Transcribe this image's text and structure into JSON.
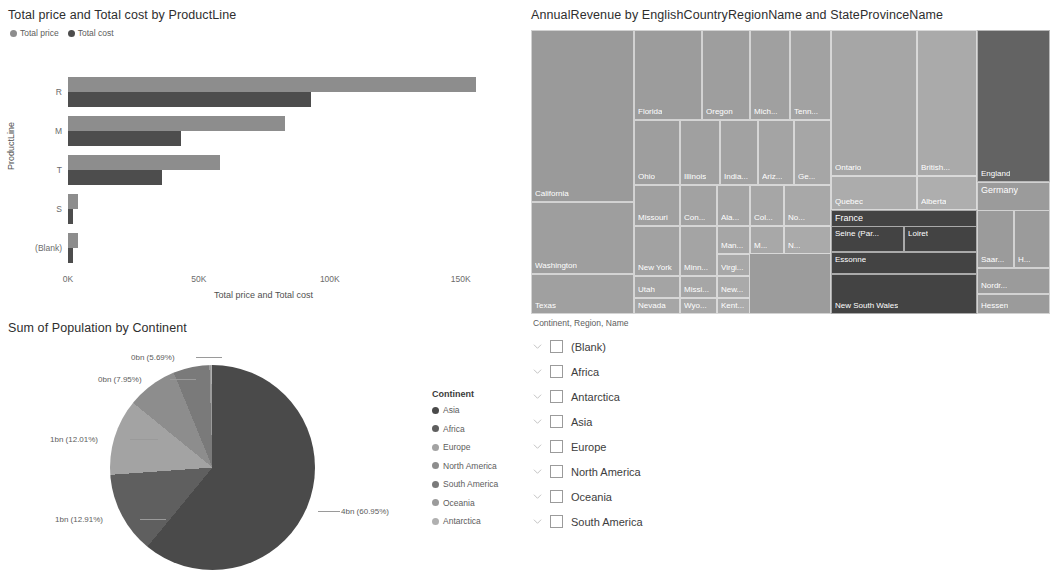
{
  "bar_chart": {
    "title": "Total price and Total cost by ProductLine",
    "legend": [
      {
        "label": "Total price",
        "color": "#8d8d8d"
      },
      {
        "label": "Total cost",
        "color": "#4d4d4d"
      }
    ],
    "x_axis_title": "Total price and Total cost",
    "y_axis_title": "ProductLine",
    "x_ticks": [
      "0K",
      "50K",
      "100K",
      "150K"
    ]
  },
  "chart_data": [
    {
      "type": "bar",
      "title": "Total price and Total cost by ProductLine",
      "xlabel": "Total price and Total cost",
      "ylabel": "ProductLine",
      "orientation": "horizontal",
      "categories": [
        "R",
        "M",
        "T",
        "S",
        "(Blank)"
      ],
      "series": [
        {
          "name": "Total price",
          "color": "#8d8d8d",
          "values": [
            156000,
            83000,
            58000,
            4000,
            4000
          ]
        },
        {
          "name": "Total cost",
          "color": "#4d4d4d",
          "values": [
            93000,
            43000,
            36000,
            2000,
            2000
          ]
        }
      ],
      "xlim": [
        0,
        165000
      ],
      "xticks": [
        0,
        50000,
        100000,
        150000
      ],
      "xticklabels": [
        "0K",
        "50K",
        "100K",
        "150K"
      ],
      "grid": false,
      "legend_position": "top-left"
    },
    {
      "type": "treemap",
      "title": "AnnualRevenue by EnglishCountryRegionName and StateProvinceName",
      "groups": [
        {
          "name": "United States",
          "color": "#9b9b9b",
          "children": [
            "California",
            "Washington",
            "Texas",
            "Florida",
            "Oregon",
            "Mich...",
            "Tenn...",
            "Ohio",
            "Illinois",
            "India...",
            "Ariz...",
            "Ge...",
            "Missouri",
            "New York",
            "Utah",
            "Nevada",
            "Con...",
            "Minn...",
            "Missi...",
            "Wyo...",
            "Ala...",
            "Man...",
            "Virgi...",
            "New...",
            "Kent...",
            "Col...",
            "M...",
            "No...",
            "N..."
          ]
        },
        {
          "name": "Canada",
          "color": "#a8a8a8",
          "children": [
            "Ontario",
            "British...",
            "Quebec",
            "Alberta"
          ]
        },
        {
          "name": "France",
          "color": "#4a4a4a",
          "children": [
            "Seine (Par...",
            "Loiret",
            "Essonne"
          ]
        },
        {
          "name": "Australia",
          "color": "#4a4a4a",
          "children": [
            "New South Wales"
          ]
        },
        {
          "name": "United ...",
          "color": "#636363",
          "children": [
            "England"
          ]
        },
        {
          "name": "Germany",
          "color": "#9b9b9b",
          "children": [
            "Saar...",
            "H...",
            "Nordr...",
            "Hessen"
          ]
        }
      ]
    },
    {
      "type": "pie",
      "title": "Sum of Population by Continent",
      "legend_title": "Continent",
      "labels": [
        "Asia",
        "Africa",
        "Europe",
        "North America",
        "South America",
        "Oceania",
        "Antarctica"
      ],
      "values": [
        60.95,
        12.91,
        12.01,
        7.95,
        5.69,
        0.3,
        0.19
      ],
      "value_labels": [
        "4bn (60.95%)",
        "1bn (12.91%)",
        "1bn (12.01%)",
        "0bn (7.95%)",
        "0bn (5.69%)"
      ],
      "colors": [
        "#4a4a4a",
        "#5f5f5f",
        "#a3a3a3",
        "#8d8d8d",
        "#7a7a7a",
        "#9b9b9b",
        "#b0b0b0"
      ],
      "legend_position": "right"
    }
  ],
  "treemap": {
    "title": "AnnualRevenue by EnglishCountryRegionName and StateProvinceName",
    "cells": [
      {
        "label": "United States",
        "x": 0,
        "y": 0,
        "w": 300,
        "h": 284,
        "color": "#9c9c9c",
        "pos": "tl",
        "size": 9
      },
      {
        "label": "California",
        "x": 0,
        "y": 0,
        "w": 103,
        "h": 172,
        "color": "#9a9a9a",
        "pos": "bl"
      },
      {
        "label": "Washington",
        "x": 0,
        "y": 172,
        "w": 103,
        "h": 72,
        "color": "#9e9e9e",
        "pos": "bl"
      },
      {
        "label": "Texas",
        "x": 0,
        "y": 244,
        "w": 103,
        "h": 40,
        "color": "#a0a0a0",
        "pos": "bl"
      },
      {
        "label": "Florida",
        "x": 103,
        "y": 0,
        "w": 68,
        "h": 90,
        "color": "#9c9c9c",
        "pos": "bl"
      },
      {
        "label": "Oregon",
        "x": 171,
        "y": 0,
        "w": 48,
        "h": 90,
        "color": "#9e9e9e",
        "pos": "bl"
      },
      {
        "label": "Mich...",
        "x": 219,
        "y": 0,
        "w": 40,
        "h": 90,
        "color": "#a0a0a0",
        "pos": "bl"
      },
      {
        "label": "Tenn...",
        "x": 259,
        "y": 0,
        "w": 41,
        "h": 90,
        "color": "#a2a2a2",
        "pos": "bl"
      },
      {
        "label": "Ohio",
        "x": 103,
        "y": 90,
        "w": 46,
        "h": 65,
        "color": "#9e9e9e",
        "pos": "bl"
      },
      {
        "label": "Illinois",
        "x": 149,
        "y": 90,
        "w": 40,
        "h": 65,
        "color": "#a0a0a0",
        "pos": "bl"
      },
      {
        "label": "India...",
        "x": 189,
        "y": 90,
        "w": 38,
        "h": 65,
        "color": "#a2a2a2",
        "pos": "bl"
      },
      {
        "label": "Ariz...",
        "x": 227,
        "y": 90,
        "w": 36,
        "h": 65,
        "color": "#a4a4a4",
        "pos": "bl"
      },
      {
        "label": "Ge...",
        "x": 263,
        "y": 90,
        "w": 37,
        "h": 65,
        "color": "#a6a6a6",
        "pos": "bl"
      },
      {
        "label": "Missouri",
        "x": 103,
        "y": 155,
        "w": 46,
        "h": 41,
        "color": "#a0a0a0",
        "pos": "bl"
      },
      {
        "label": "New York",
        "x": 103,
        "y": 196,
        "w": 46,
        "h": 50,
        "color": "#a2a2a2",
        "pos": "bl"
      },
      {
        "label": "Utah",
        "x": 103,
        "y": 246,
        "w": 46,
        "h": 22,
        "color": "#a4a4a4",
        "pos": "bl"
      },
      {
        "label": "Nevada",
        "x": 103,
        "y": 268,
        "w": 46,
        "h": 16,
        "color": "#a6a6a6",
        "pos": "bl"
      },
      {
        "label": "Con...",
        "x": 149,
        "y": 155,
        "w": 37,
        "h": 41,
        "color": "#a2a2a2",
        "pos": "bl"
      },
      {
        "label": "Minn...",
        "x": 149,
        "y": 196,
        "w": 37,
        "h": 50,
        "color": "#a4a4a4",
        "pos": "bl"
      },
      {
        "label": "Missi...",
        "x": 149,
        "y": 246,
        "w": 37,
        "h": 22,
        "color": "#a6a6a6",
        "pos": "bl"
      },
      {
        "label": "Wyo...",
        "x": 149,
        "y": 268,
        "w": 37,
        "h": 16,
        "color": "#a8a8a8",
        "pos": "bl"
      },
      {
        "label": "Ala...",
        "x": 186,
        "y": 155,
        "w": 33,
        "h": 41,
        "color": "#a4a4a4",
        "pos": "bl"
      },
      {
        "label": "Man...",
        "x": 186,
        "y": 196,
        "w": 33,
        "h": 28,
        "color": "#a6a6a6",
        "pos": "bl"
      },
      {
        "label": "Virgi...",
        "x": 186,
        "y": 224,
        "w": 33,
        "h": 22,
        "color": "#a8a8a8",
        "pos": "bl"
      },
      {
        "label": "New...",
        "x": 186,
        "y": 246,
        "w": 33,
        "h": 22,
        "color": "#aaaaaa",
        "pos": "bl"
      },
      {
        "label": "Kent...",
        "x": 186,
        "y": 268,
        "w": 33,
        "h": 16,
        "color": "#acacac",
        "pos": "bl"
      },
      {
        "label": "Col...",
        "x": 219,
        "y": 155,
        "w": 34,
        "h": 41,
        "color": "#a6a6a6",
        "pos": "bl"
      },
      {
        "label": "M...",
        "x": 219,
        "y": 196,
        "w": 34,
        "h": 28,
        "color": "#a8a8a8",
        "pos": "bl"
      },
      {
        "label": "No...",
        "x": 253,
        "y": 155,
        "w": 47,
        "h": 41,
        "color": "#a8a8a8",
        "pos": "bl"
      },
      {
        "label": "N...",
        "x": 253,
        "y": 196,
        "w": 47,
        "h": 28,
        "color": "#aaaaaa",
        "pos": "bl"
      },
      {
        "label": "Canada",
        "x": 300,
        "y": 0,
        "w": 146,
        "h": 180,
        "color": "#a8a8a8",
        "pos": "tl",
        "size": 9
      },
      {
        "label": "Ontario",
        "x": 300,
        "y": 0,
        "w": 86,
        "h": 146,
        "color": "#a6a6a6",
        "pos": "bl"
      },
      {
        "label": "British...",
        "x": 386,
        "y": 0,
        "w": 60,
        "h": 146,
        "color": "#aaaaaa",
        "pos": "bl"
      },
      {
        "label": "Quebec",
        "x": 300,
        "y": 146,
        "w": 86,
        "h": 34,
        "color": "#acacac",
        "pos": "bl"
      },
      {
        "label": "Alberta",
        "x": 386,
        "y": 146,
        "w": 60,
        "h": 34,
        "color": "#aeaeae",
        "pos": "bl"
      },
      {
        "label": "United ...",
        "x": 446,
        "y": 0,
        "w": 73,
        "h": 152,
        "color": "#636363",
        "pos": "tl",
        "size": 9
      },
      {
        "label": "England",
        "x": 446,
        "y": 0,
        "w": 73,
        "h": 152,
        "color": "#636363",
        "pos": "bl"
      },
      {
        "label": "France",
        "x": 300,
        "y": 180,
        "w": 146,
        "h": 64,
        "color": "#434343",
        "pos": "tl",
        "size": 9
      },
      {
        "label": "Seine (Par...",
        "x": 300,
        "y": 196,
        "w": 73,
        "h": 26,
        "color": "#434343",
        "pos": "tl"
      },
      {
        "label": "Loiret",
        "x": 373,
        "y": 196,
        "w": 73,
        "h": 26,
        "color": "#434343",
        "pos": "tl"
      },
      {
        "label": "Essonne",
        "x": 300,
        "y": 222,
        "w": 146,
        "h": 22,
        "color": "#434343",
        "pos": "tl"
      },
      {
        "label": "Australia",
        "x": 300,
        "y": 244,
        "w": 146,
        "h": 40,
        "color": "#434343",
        "pos": "tl",
        "size": 9
      },
      {
        "label": "New South Wales",
        "x": 300,
        "y": 244,
        "w": 146,
        "h": 40,
        "color": "#434343",
        "pos": "bl"
      },
      {
        "label": "Germany",
        "x": 446,
        "y": 152,
        "w": 73,
        "h": 132,
        "color": "#9b9b9b",
        "pos": "tl",
        "size": 9
      },
      {
        "label": "Saar...",
        "x": 446,
        "y": 180,
        "w": 37,
        "h": 58,
        "color": "#9b9b9b",
        "pos": "bl"
      },
      {
        "label": "H...",
        "x": 483,
        "y": 180,
        "w": 36,
        "h": 58,
        "color": "#9b9b9b",
        "pos": "bl"
      },
      {
        "label": "Nordr...",
        "x": 446,
        "y": 238,
        "w": 73,
        "h": 26,
        "color": "#9b9b9b",
        "pos": "bl"
      },
      {
        "label": "Hessen",
        "x": 446,
        "y": 264,
        "w": 73,
        "h": 20,
        "color": "#9b9b9b",
        "pos": "bl"
      }
    ]
  },
  "pie_chart": {
    "title": "Sum of Population by Continent",
    "legend_title": "Continent",
    "legend_items": [
      {
        "label": "Asia",
        "color": "#4a4a4a"
      },
      {
        "label": "Africa",
        "color": "#5f5f5f"
      },
      {
        "label": "Europe",
        "color": "#a3a3a3"
      },
      {
        "label": "North America",
        "color": "#8d8d8d"
      },
      {
        "label": "South America",
        "color": "#7a7a7a"
      },
      {
        "label": "Oceania",
        "color": "#9b9b9b"
      },
      {
        "label": "Antarctica",
        "color": "#b0b0b0"
      }
    ],
    "callouts": [
      {
        "text": "0bn (5.69%)",
        "x": 131,
        "y": 38
      },
      {
        "text": "0bn (7.95%)",
        "x": 98,
        "y": 60
      },
      {
        "text": "1bn (12.01%)",
        "x": 50,
        "y": 120
      },
      {
        "text": "1bn (12.91%)",
        "x": 55,
        "y": 200
      },
      {
        "text": "4bn (60.95%)",
        "x": 341,
        "y": 192
      }
    ]
  },
  "slicer": {
    "title": "Continent, Region, Name",
    "items": [
      {
        "label": "(Blank)",
        "checked": false
      },
      {
        "label": "Africa",
        "checked": false
      },
      {
        "label": "Antarctica",
        "checked": false
      },
      {
        "label": "Asia",
        "checked": false
      },
      {
        "label": "Europe",
        "checked": false
      },
      {
        "label": "North America",
        "checked": false
      },
      {
        "label": "Oceania",
        "checked": false
      },
      {
        "label": "South America",
        "checked": false
      }
    ]
  }
}
